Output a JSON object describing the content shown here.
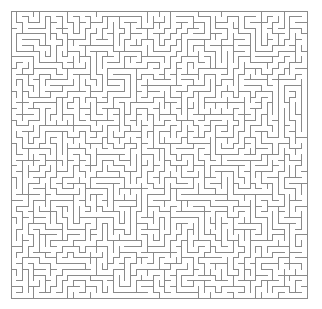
{
  "app": {
    "title": "Maze",
    "type": "maze-puzzle-image"
  },
  "canvas": {
    "width": 322,
    "height": 309,
    "background_color": "#ffffff"
  },
  "maze": {
    "name": "perfect-maze",
    "origin_x": 11,
    "origin_y": 11,
    "width_px": 296,
    "height_px": 287,
    "cols": 52,
    "rows": 50,
    "cell_px": 5.7,
    "wall_color": "#8a8a8a",
    "wall_thickness_px": 1,
    "background_color": "#ffffff",
    "border_closed": true,
    "entrance": null,
    "exit": null,
    "seed": 20240517,
    "algorithm": "depth-first-search-backtracker"
  },
  "labels": {
    "title_text": "",
    "caption_text": "",
    "has_text": false
  }
}
